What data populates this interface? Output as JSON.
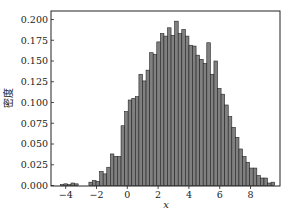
{
  "chart_data": {
    "type": "bar",
    "subtype": "histogram",
    "title": "",
    "xlabel": "x",
    "ylabel": "密度",
    "xlim": [
      -4.8,
      9.9
    ],
    "ylim": [
      0.0,
      0.209
    ],
    "xticks": [
      -4,
      -2,
      0,
      2,
      4,
      6,
      8
    ],
    "xtick_labels": [
      "−4",
      "−2",
      "0",
      "2",
      "4",
      "6",
      "8"
    ],
    "yticks": [
      0.0,
      0.025,
      0.05,
      0.075,
      0.1,
      0.125,
      0.15,
      0.175,
      0.2
    ],
    "ytick_labels": [
      "0.000",
      "0.025",
      "0.050",
      "0.075",
      "0.100",
      "0.125",
      "0.150",
      "0.175",
      "0.200"
    ],
    "grid": false,
    "legend": null,
    "bar_color": "#808080",
    "edge_color": "#222222",
    "bin_edges_start": -4.35,
    "bin_width": 0.232,
    "values": [
      0.001,
      0.002,
      0.001,
      0.003,
      0.002,
      0.0,
      0.0,
      0.0,
      0.004,
      0.006,
      0.005,
      0.017,
      0.014,
      0.022,
      0.038,
      0.035,
      0.035,
      0.072,
      0.089,
      0.103,
      0.105,
      0.107,
      0.134,
      0.126,
      0.139,
      0.16,
      0.158,
      0.173,
      0.183,
      0.18,
      0.19,
      0.181,
      0.198,
      0.183,
      0.188,
      0.18,
      0.169,
      0.168,
      0.157,
      0.152,
      0.147,
      0.172,
      0.134,
      0.15,
      0.117,
      0.11,
      0.097,
      0.083,
      0.07,
      0.058,
      0.044,
      0.035,
      0.028,
      0.021,
      0.021,
      0.012,
      0.009,
      0.009,
      0.003,
      0.004
    ]
  }
}
